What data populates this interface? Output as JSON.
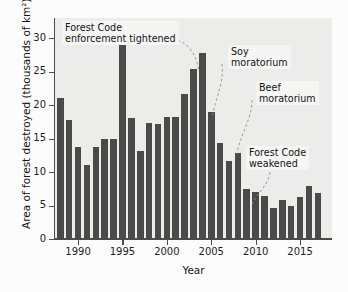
{
  "chart_data": {
    "type": "bar",
    "title": "",
    "xlabel": "Year",
    "ylabel": "Area of forest destroyed (thousands of km²)",
    "ylim": [
      0,
      33
    ],
    "xlim": [
      1987.4,
      2018.6
    ],
    "grid": false,
    "legend": null,
    "bar_color": "#4a4a4a",
    "plot_background": "#ececeb",
    "ytick_labels": [
      "0",
      "5",
      "10",
      "15",
      "20",
      "25",
      "30"
    ],
    "ytick_values": [
      0,
      5,
      10,
      15,
      20,
      25,
      30
    ],
    "xtick_labels": [
      "1990",
      "1995",
      "2000",
      "2005",
      "2010",
      "2015"
    ],
    "xtick_values": [
      1990,
      1995,
      2000,
      2005,
      2010,
      2015
    ],
    "categories": [
      1988,
      1989,
      1990,
      1991,
      1992,
      1993,
      1994,
      1995,
      1996,
      1997,
      1998,
      1999,
      2000,
      2001,
      2002,
      2003,
      2004,
      2005,
      2006,
      2007,
      2008,
      2009,
      2010,
      2011,
      2012,
      2013,
      2014,
      2015,
      2016,
      2017
    ],
    "values": [
      21.0,
      17.7,
      13.8,
      11.0,
      13.8,
      14.9,
      14.9,
      29.1,
      18.1,
      13.1,
      17.3,
      17.2,
      18.2,
      18.2,
      21.6,
      25.4,
      27.8,
      19.0,
      14.3,
      11.6,
      12.9,
      7.4,
      7.0,
      6.4,
      4.6,
      5.8,
      5.0,
      6.2,
      7.9,
      6.9
    ],
    "annotations": [
      {
        "id": "forest-code-enforcement-tightened",
        "text": "Forest Code\nenforcement tightened",
        "target_year": 2004
      },
      {
        "id": "soy-moratorium",
        "text": "Soy\nmoratorium",
        "target_year": 2006
      },
      {
        "id": "beef-moratorium",
        "text": "Beef\nmoratorium",
        "target_year": 2009
      },
      {
        "id": "forest-code-weakened",
        "text": "Forest Code\nweakened",
        "target_year": 2012
      }
    ]
  }
}
